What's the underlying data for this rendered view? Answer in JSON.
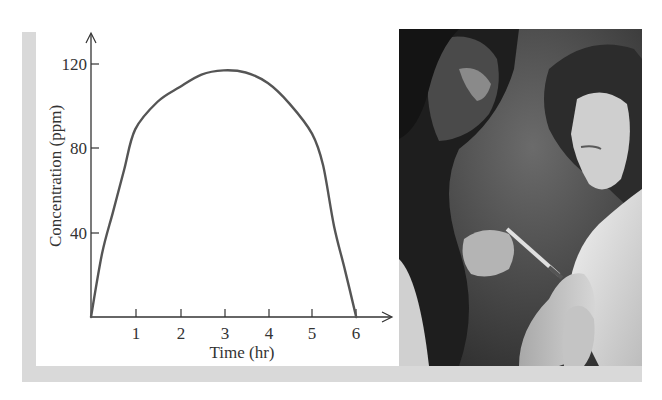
{
  "figure": {
    "frame_color": "#d9d9d9",
    "curve_color": "#555555",
    "axis_color": "#333333",
    "photo_description": "Black-and-white photograph of a doctor giving an injection in the upper arm of a young girl"
  },
  "axes": {
    "xlabel": "Time (hr)",
    "ylabel": "Concentration (ppm)",
    "x_ticks": [
      "1",
      "2",
      "3",
      "4",
      "5",
      "6"
    ],
    "y_ticks": [
      "40",
      "80",
      "120"
    ]
  },
  "chart_data": {
    "type": "line",
    "title": "",
    "xlabel": "Time (hr)",
    "ylabel": "Concentration (ppm)",
    "xlim": [
      0,
      6.8
    ],
    "ylim": [
      0,
      135
    ],
    "x_ticks": [
      1,
      2,
      3,
      4,
      5,
      6
    ],
    "y_ticks": [
      40,
      80,
      120
    ],
    "grid": false,
    "legend": null,
    "series": [
      {
        "name": "Concentration",
        "x": [
          0,
          0.25,
          0.5,
          0.75,
          1,
          1.5,
          2,
          2.5,
          3,
          3.5,
          4,
          4.5,
          5,
          5.25,
          5.5,
          5.75,
          6
        ],
        "y": [
          0,
          30,
          50,
          70,
          89,
          102,
          109,
          115,
          117,
          116,
          111,
          101,
          87,
          72,
          43,
          22,
          0
        ]
      }
    ]
  }
}
